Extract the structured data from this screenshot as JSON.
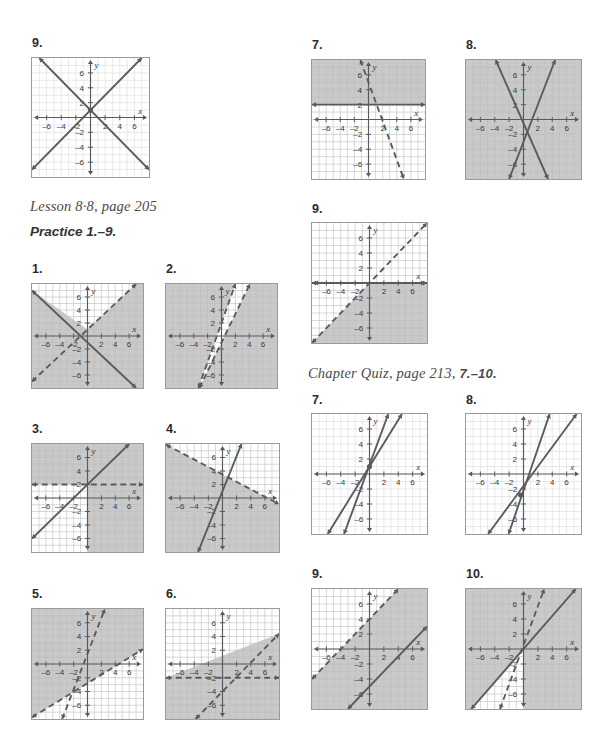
{
  "document": {
    "kind": "math-answer-key-page",
    "page_width": 593,
    "page_height": 743
  },
  "headings": [
    {
      "id": "lesson-88",
      "text": "Lesson 8·8, page 205",
      "x": 30,
      "y": 204
    },
    {
      "id": "practice-1-9",
      "text": "Practice 1.–9.",
      "x": 30,
      "y": 230
    },
    {
      "id": "chapter-quiz",
      "text": "Chapter Quiz, page 213, ",
      "bold_suffix": "7.–10.",
      "x": 308,
      "y": 371
    }
  ],
  "colors": {
    "shade": "#c9c9c9",
    "shade_dark": "#b4b4b4",
    "line": "#5a5a5a",
    "axis": "#5a5a5a",
    "grid": "#d9d9d9",
    "grid_on_shade": "#bdbdbd",
    "frame": "#9a9a9a",
    "page_bg": "#ffffff",
    "heading": "#4a4a4a"
  },
  "axis_labels": {
    "x": "x",
    "y": "y",
    "x_ticks": [
      "–6",
      "–4",
      "–2",
      "2",
      "4",
      "6"
    ],
    "y_ticks": [
      "6",
      "4",
      "2",
      "–2",
      "–4",
      "–6"
    ],
    "range": [
      -8,
      8
    ]
  },
  "chart_data": [
    {
      "id": "g-top-9",
      "label": "9.",
      "type": "line",
      "column": "left",
      "box": {
        "x": 31,
        "y": 57,
        "w": 119,
        "h": 121
      },
      "title": "",
      "xlabel": "x",
      "ylabel": "y",
      "xlim": [
        -8,
        8
      ],
      "ylim": [
        -8,
        8
      ],
      "grid": true,
      "shaded_regions": [],
      "lines": [
        {
          "name": "y = x + 1",
          "slope": 1,
          "intercept": 1,
          "style": "solid",
          "arrows": "both"
        },
        {
          "name": "y = -x + 1",
          "slope": -1,
          "intercept": 1,
          "style": "solid",
          "arrows": "both"
        }
      ],
      "points": [
        {
          "x": 0,
          "y": 1,
          "filled": true
        }
      ]
    },
    {
      "id": "g-top-7",
      "label": "7.",
      "type": "line",
      "column": "right",
      "box": {
        "x": 311,
        "y": 59,
        "w": 115,
        "h": 121
      },
      "xlabel": "x",
      "ylabel": "y",
      "xlim": [
        -8,
        8
      ],
      "ylim": [
        -8,
        8
      ],
      "grid": true,
      "shaded_regions": [
        {
          "desc": "left-of-dashed-line and above-x-axis region plus left half",
          "fill": "#c9c9c9"
        }
      ],
      "lines": [
        {
          "name": "y = 2 (solid horizontal)",
          "slope": 0,
          "intercept": 2,
          "style": "solid",
          "arrows": "both"
        },
        {
          "name": "steep negative dashed",
          "slope": -2.6,
          "intercept": 5,
          "style": "dashed",
          "arrows": "both"
        }
      ]
    },
    {
      "id": "g-top-8",
      "label": "8.",
      "type": "line",
      "column": "right",
      "box": {
        "x": 465,
        "y": 59,
        "w": 117,
        "h": 121
      },
      "xlabel": "x",
      "ylabel": "y",
      "xlim": [
        -8,
        8
      ],
      "ylim": [
        -8,
        8
      ],
      "grid": true,
      "shaded_regions": [
        {
          "desc": "right wedge between two solid lines",
          "fill": "#c9c9c9"
        }
      ],
      "lines": [
        {
          "name": "steep positive solid",
          "slope": 2.5,
          "intercept": -3,
          "style": "solid",
          "arrows": "both"
        },
        {
          "name": "steep negative solid",
          "slope": -2.2,
          "intercept": -0.5,
          "style": "solid",
          "arrows": "both"
        }
      ]
    },
    {
      "id": "g-right-9",
      "label": "9.",
      "type": "line",
      "column": "right",
      "box": {
        "x": 311,
        "y": 222,
        "w": 117,
        "h": 122
      },
      "xlabel": "x",
      "ylabel": "y",
      "xlim": [
        -8,
        8
      ],
      "ylim": [
        -8,
        8
      ],
      "grid": true,
      "shaded_regions": [
        {
          "desc": "below y = x and below x-axis",
          "fill": "#c9c9c9"
        }
      ],
      "lines": [
        {
          "name": "y = x dashed",
          "slope": 1,
          "intercept": 0,
          "style": "dashed",
          "arrows": "both"
        },
        {
          "name": "y = 0 solid (x-axis heavy)",
          "slope": 0,
          "intercept": 0,
          "style": "solid",
          "arrows": "both"
        }
      ]
    },
    {
      "id": "g-p1",
      "label": "1.",
      "type": "line",
      "column": "left",
      "box": {
        "x": 31,
        "y": 283,
        "w": 113,
        "h": 106
      },
      "xlabel": "x",
      "ylabel": "y",
      "xlim": [
        -8,
        8
      ],
      "ylim": [
        -8,
        8
      ],
      "grid": true,
      "shaded_regions": [
        {
          "desc": "below both lines (lower wedge)",
          "fill": "#c9c9c9"
        }
      ],
      "lines": [
        {
          "name": "y = x + 1 dashed",
          "slope": 1,
          "intercept": 1,
          "style": "dashed",
          "arrows": "both"
        },
        {
          "name": "y = -x - 1 solid",
          "slope": -1,
          "intercept": -1,
          "style": "solid",
          "arrows": "both"
        }
      ]
    },
    {
      "id": "g-p2",
      "label": "2.",
      "type": "line",
      "column": "left",
      "box": {
        "x": 165,
        "y": 283,
        "w": 113,
        "h": 106
      },
      "xlabel": "x",
      "ylabel": "y",
      "xlim": [
        -8,
        8
      ],
      "ylim": [
        -8,
        8
      ],
      "grid": true,
      "shaded_regions": [
        {
          "desc": "everything except narrow strip between parallel-ish dashed lines",
          "fill": "#c9c9c9"
        }
      ],
      "lines": [
        {
          "name": "steep dashed A",
          "slope": 3,
          "intercept": 2,
          "style": "dashed",
          "arrows": "both"
        },
        {
          "name": "steep dashed B",
          "slope": 2.2,
          "intercept": -1,
          "style": "dashed",
          "arrows": "both"
        }
      ]
    },
    {
      "id": "g-p3",
      "label": "3.",
      "type": "line",
      "column": "left",
      "box": {
        "x": 31,
        "y": 443,
        "w": 113,
        "h": 110
      },
      "xlabel": "x",
      "ylabel": "y",
      "xlim": [
        -8,
        8
      ],
      "ylim": [
        -8,
        8
      ],
      "grid": true,
      "shaded_regions": [
        {
          "desc": "above y = 2 region unioned with left of y = x",
          "fill": "#c9c9c9"
        }
      ],
      "lines": [
        {
          "name": "y = x + 2 solid",
          "slope": 1,
          "intercept": 2,
          "style": "solid",
          "arrows": "both"
        },
        {
          "name": "y = 2 dashed",
          "slope": 0,
          "intercept": 2,
          "style": "dashed",
          "arrows": "both"
        }
      ]
    },
    {
      "id": "g-p4",
      "label": "4.",
      "type": "line",
      "column": "left",
      "box": {
        "x": 165,
        "y": 443,
        "w": 115,
        "h": 110
      },
      "xlabel": "x",
      "ylabel": "y",
      "xlim": [
        -8,
        8
      ],
      "ylim": [
        -8,
        8
      ],
      "grid": true,
      "shaded_regions": [
        {
          "desc": "region under dashed and left of solid",
          "fill": "#c9c9c9"
        }
      ],
      "lines": [
        {
          "name": "steep positive solid",
          "slope": 2.6,
          "intercept": 1,
          "style": "solid",
          "arrows": "both"
        },
        {
          "name": "shallow negative dashed",
          "slope": -0.55,
          "intercept": 3.5,
          "style": "dashed",
          "arrows": "both"
        }
      ]
    },
    {
      "id": "g-p5",
      "label": "5.",
      "type": "line",
      "column": "left",
      "box": {
        "x": 31,
        "y": 608,
        "w": 113,
        "h": 112
      },
      "xlabel": "x",
      "ylabel": "y",
      "xlim": [
        -8,
        8
      ],
      "ylim": [
        -8,
        8
      ],
      "grid": true,
      "shaded_regions": [
        {
          "desc": "all except lower-left wedge",
          "fill": "#c9c9c9"
        }
      ],
      "lines": [
        {
          "name": "steep dashed",
          "slope": 2.6,
          "intercept": 1.5,
          "style": "dashed",
          "arrows": "both"
        },
        {
          "name": "shallow dashed",
          "slope": 0.62,
          "intercept": -2.8,
          "style": "dashed",
          "arrows": "both"
        }
      ]
    },
    {
      "id": "g-p6",
      "label": "6.",
      "type": "line",
      "column": "left",
      "box": {
        "x": 165,
        "y": 608,
        "w": 115,
        "h": 112
      },
      "xlabel": "x",
      "ylabel": "y",
      "xlim": [
        -8,
        8
      ],
      "ylim": [
        -8,
        8
      ],
      "grid": true,
      "shaded_regions": [
        {
          "desc": "above dashed horizontal union left of dashed diagonal",
          "fill": "#c9c9c9"
        }
      ],
      "lines": [
        {
          "name": "y = x - 4 dashed",
          "slope": 1.05,
          "intercept": -4,
          "style": "dashed",
          "arrows": "both"
        },
        {
          "name": "y = -2 dashed horizontal",
          "slope": 0,
          "intercept": -2,
          "style": "dashed",
          "arrows": "both"
        }
      ]
    },
    {
      "id": "g-q7",
      "label": "7.",
      "type": "line",
      "column": "right",
      "box": {
        "x": 311,
        "y": 413,
        "w": 117,
        "h": 122
      },
      "xlabel": "x",
      "ylabel": "y",
      "xlim": [
        -8,
        8
      ],
      "ylim": [
        -8,
        8
      ],
      "grid": true,
      "shaded_regions": [],
      "lines": [
        {
          "name": "steeper solid",
          "slope": 2.6,
          "intercept": 1.2,
          "style": "solid",
          "arrows": "both"
        },
        {
          "name": "less steep solid",
          "slope": 1.55,
          "intercept": 1.0,
          "style": "solid",
          "arrows": "both"
        }
      ],
      "points": [
        {
          "x": 0,
          "y": 1,
          "filled": true
        }
      ]
    },
    {
      "id": "g-q8",
      "label": "8.",
      "type": "line",
      "column": "right",
      "box": {
        "x": 465,
        "y": 413,
        "w": 117,
        "h": 122
      },
      "xlabel": "x",
      "ylabel": "y",
      "xlim": [
        -8,
        8
      ],
      "ylim": [
        -8,
        8
      ],
      "grid": true,
      "shaded_regions": [],
      "lines": [
        {
          "name": "steeper solid",
          "slope": 2.8,
          "intercept": -2.2,
          "style": "solid",
          "arrows": "both"
        },
        {
          "name": "less steep solid",
          "slope": 1.3,
          "intercept": -1.6,
          "style": "solid",
          "arrows": "both"
        }
      ],
      "points": [
        {
          "x": -0.4,
          "y": -2.8,
          "filled": true
        }
      ]
    },
    {
      "id": "g-q9",
      "label": "9.",
      "type": "line",
      "column": "right",
      "box": {
        "x": 311,
        "y": 588,
        "w": 117,
        "h": 122
      },
      "xlabel": "x",
      "ylabel": "y",
      "xlim": [
        -8,
        8
      ],
      "ylim": [
        -8,
        8
      ],
      "grid": true,
      "shaded_regions": [
        {
          "desc": "below dashed line, full lower-right shading",
          "fill": "#c9c9c9"
        }
      ],
      "lines": [
        {
          "name": "y = x + 4 dashed",
          "slope": 1,
          "intercept": 4,
          "style": "dashed",
          "arrows": "both"
        },
        {
          "name": "y = x - 5 solid",
          "slope": 1,
          "intercept": -5,
          "style": "solid",
          "arrows": "both"
        }
      ]
    },
    {
      "id": "g-q10",
      "label": "10.",
      "type": "line",
      "column": "right",
      "box": {
        "x": 465,
        "y": 588,
        "w": 117,
        "h": 122
      },
      "xlabel": "x",
      "ylabel": "y",
      "xlim": [
        -8,
        8
      ],
      "ylim": [
        -8,
        8
      ],
      "grid": true,
      "shaded_regions": [
        {
          "desc": "above solid line / right of dashed",
          "fill": "#c9c9c9"
        }
      ],
      "lines": [
        {
          "name": "steep dashed",
          "slope": 2.6,
          "intercept": 0.5,
          "style": "dashed",
          "arrows": "both"
        },
        {
          "name": "y = x solid",
          "slope": 1.1,
          "intercept": 0,
          "style": "solid",
          "arrows": "both"
        }
      ]
    }
  ],
  "question_numbers": [
    {
      "id": "n-top-9",
      "text": "9.",
      "x": 32,
      "y": 36
    },
    {
      "id": "n-top-7",
      "text": "7.",
      "x": 312,
      "y": 38
    },
    {
      "id": "n-top-8",
      "text": "8.",
      "x": 466,
      "y": 38
    },
    {
      "id": "n-right-9",
      "text": "9.",
      "x": 312,
      "y": 202
    },
    {
      "id": "n-p1",
      "text": "1.",
      "x": 32,
      "y": 262
    },
    {
      "id": "n-p2",
      "text": "2.",
      "x": 166,
      "y": 262
    },
    {
      "id": "n-p3",
      "text": "3.",
      "x": 32,
      "y": 422
    },
    {
      "id": "n-p4",
      "text": "4.",
      "x": 166,
      "y": 422
    },
    {
      "id": "n-p5",
      "text": "5.",
      "x": 32,
      "y": 587
    },
    {
      "id": "n-p6",
      "text": "6.",
      "x": 166,
      "y": 587
    },
    {
      "id": "n-q7",
      "text": "7.",
      "x": 312,
      "y": 393
    },
    {
      "id": "n-q8",
      "text": "8.",
      "x": 466,
      "y": 393
    },
    {
      "id": "n-q9",
      "text": "9.",
      "x": 312,
      "y": 567
    },
    {
      "id": "n-q10",
      "text": "10.",
      "x": 466,
      "y": 567
    }
  ]
}
